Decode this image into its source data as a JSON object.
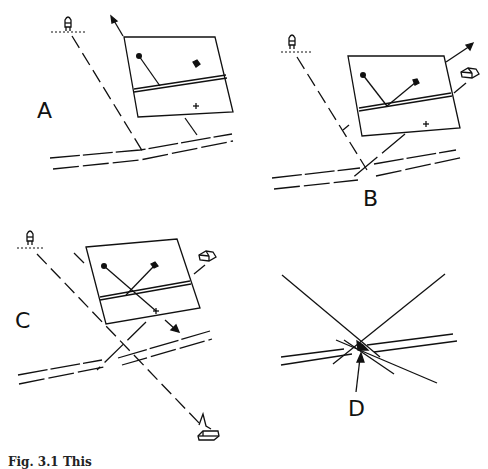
{
  "figure": {
    "panels": [
      {
        "id": "A",
        "label": "A"
      },
      {
        "id": "B",
        "label": "B"
      },
      {
        "id": "C",
        "label": "C"
      },
      {
        "id": "D",
        "label": "D"
      }
    ],
    "caption": "Fig. 3.1 This"
  },
  "icons": {
    "lighthouse": "lighthouse-icon",
    "house": "house-icon",
    "boat": "boat-icon",
    "arrow": "arrow-icon"
  },
  "colors": {
    "ink": "#111111",
    "background": "#ffffff"
  }
}
